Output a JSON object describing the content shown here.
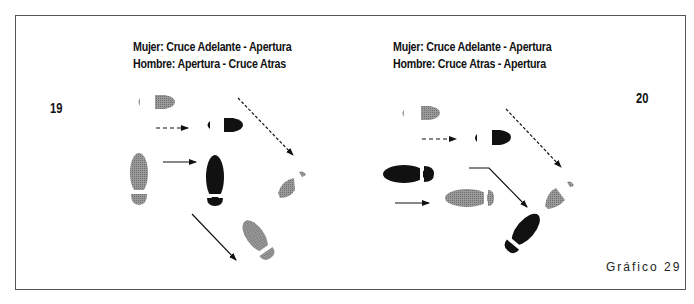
{
  "figure": {
    "label": "Gráfico 29",
    "colors": {
      "man": "#111111",
      "woman": "#8a8a8a",
      "border": "#555555"
    }
  },
  "diagrams": [
    {
      "number": "19",
      "caption": {
        "line1": "Mujer: Cruce Adelante - Apertura",
        "line2": "Hombre: Apertura - Cruce Atras"
      }
    },
    {
      "number": "20",
      "caption": {
        "line1": "Mujer: Cruce Adelante - Apertura",
        "line2": "Hombre: Cruce Atras - Apertura"
      }
    }
  ]
}
